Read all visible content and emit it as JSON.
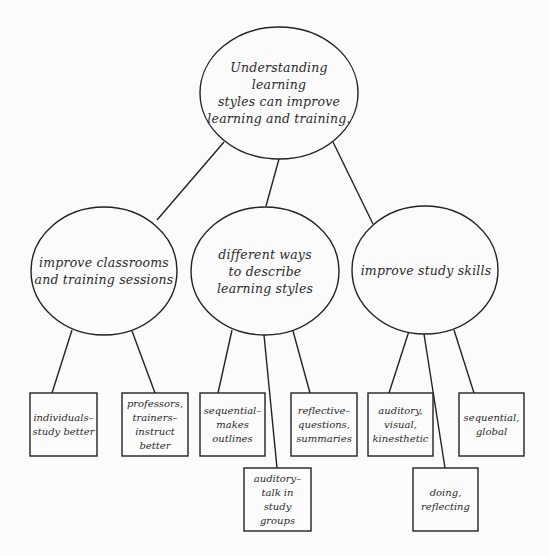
{
  "diagram": {
    "type": "concept-map",
    "colors": {
      "stroke": "#222222",
      "text": "#2a2a2a",
      "background": "#fbfbfb"
    },
    "root": {
      "label": "Understanding learning\nstyles can improve\nlearning and training."
    },
    "branches": [
      {
        "label": "improve classrooms\nand training sessions",
        "children": [
          {
            "label": "individuals–\nstudy better"
          },
          {
            "label": "professors,\ntrainers–\ninstruct\nbetter"
          }
        ]
      },
      {
        "label": "different ways\nto describe\nlearning styles",
        "children": [
          {
            "label": "sequential–\nmakes\noutlines"
          },
          {
            "label": "auditory–\ntalk in\nstudy\ngroups"
          },
          {
            "label": "reflective–\nquestions,\nsummaries"
          }
        ]
      },
      {
        "label": "improve study skills",
        "children": [
          {
            "label": "auditory,\nvisual,\nkinesthetic"
          },
          {
            "label": "doing,\nreflecting"
          },
          {
            "label": "sequential,\nglobal"
          }
        ]
      }
    ]
  }
}
